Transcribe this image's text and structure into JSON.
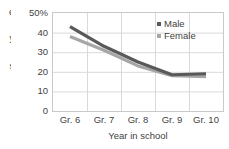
{
  "chart_data": {
    "type": "line",
    "title": "",
    "subtitle": "",
    "xlabel": "Year in school",
    "ylabel": "",
    "categories": [
      "Gr. 6",
      "Gr. 7",
      "Gr. 8",
      "Gr. 9",
      "Gr. 10"
    ],
    "series": [
      {
        "name": "Male",
        "values": [
          43,
          33,
          25,
          18.5,
          19
        ],
        "color": "#595959"
      },
      {
        "name": "Female",
        "values": [
          38,
          31,
          23,
          18,
          17.5
        ],
        "color": "#a6a6a6"
      }
    ],
    "ylim": [
      0,
      50
    ],
    "ytick_values": [
      0,
      10,
      20,
      30,
      40,
      50
    ],
    "ytick_labels": [
      "0",
      "10",
      "20",
      "30",
      "40",
      "50%"
    ],
    "grid": true,
    "legend_position": "top-right",
    "axis_color": "#c9c9c9",
    "grid_color": "#d9d9d9",
    "text_color": "#3f3f3f",
    "background": "#ffffff"
  },
  "y_axis_title_clipped": "e\nr\ny\n.\ns",
  "legend": {
    "items": [
      {
        "label": "Male",
        "marker": "square-marker",
        "color": "#595959"
      },
      {
        "label": "Female",
        "marker": "square-marker",
        "color": "#a6a6a6"
      }
    ]
  }
}
